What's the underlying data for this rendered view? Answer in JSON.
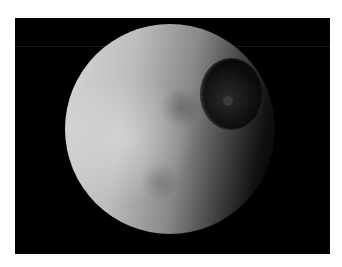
{
  "image": {
    "subject": "cratered moon with large impact crater",
    "background_color": "#000000",
    "border_color": "#ffffff"
  }
}
